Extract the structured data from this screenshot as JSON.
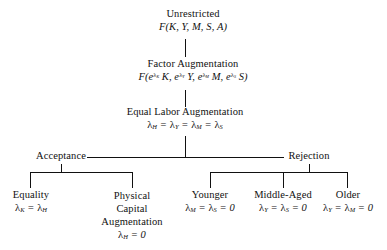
{
  "diagram": {
    "type": "tree",
    "background": "#ffffff",
    "ink": "#111111"
  },
  "nodes": {
    "unrestricted": {
      "label": "Unrestricted",
      "formula_plain": "F(K, Y, M, S, A)"
    },
    "factor_augmentation": {
      "label": "Factor Augmentation",
      "formula_plain": "F(e^λK K, e^λY Y, e^λM M, e^λS S)"
    },
    "equal_labor_augmentation": {
      "label": "Equal Labor Augmentation",
      "formula_plain": "λH = λY = λM = λS"
    },
    "acceptance": {
      "label": "Acceptance"
    },
    "rejection": {
      "label": "Rejection"
    },
    "equality": {
      "label": "Equality",
      "formula_plain": "λK = λH"
    },
    "physical_capital_augmentation": {
      "label": "Physical Capital Augmentation",
      "formula_plain": "λH = 0"
    },
    "younger": {
      "label": "Younger",
      "formula_plain": "λM = λS = 0"
    },
    "middle_aged": {
      "label": "Middle-Aged",
      "formula_plain": "λY = λS = 0"
    },
    "older": {
      "label": "Older",
      "formula_plain": "λY = λM = 0"
    }
  }
}
